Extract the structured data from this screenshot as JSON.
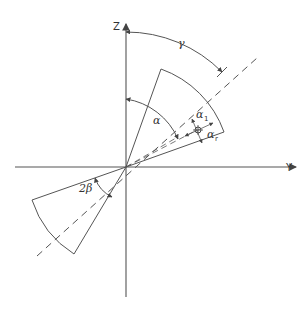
{
  "figure": {
    "type": "sector geometry diagram",
    "axes": {
      "vertical_label": "Z",
      "horizontal_label": "Y"
    },
    "angle_labels": {
      "gamma": "γ",
      "alpha": "α",
      "alpha_1": "α",
      "alpha_1_sub": "1",
      "alpha_r": "α",
      "alpha_r_sub": "r",
      "two_beta": "2β"
    },
    "colors": {
      "line": "#555555",
      "text": "#333333",
      "background": "#ffffff"
    }
  }
}
